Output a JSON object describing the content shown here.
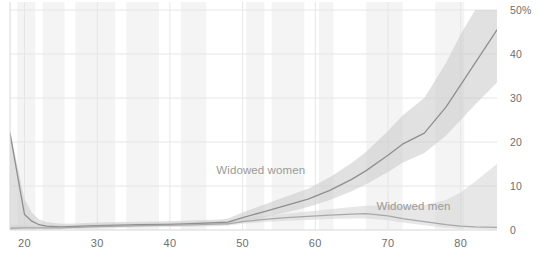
{
  "chart_data": {
    "type": "line",
    "title": "",
    "xlabel": "",
    "ylabel": "",
    "xlim": [
      18,
      85
    ],
    "ylim": [
      0,
      50
    ],
    "grid": true,
    "legend_position": "inline-annotation",
    "x_ticks": [
      20,
      30,
      40,
      50,
      60,
      70,
      80
    ],
    "x_tick_labels": [
      "20",
      "30",
      "40",
      "50",
      "60",
      "70",
      "80"
    ],
    "y_ticks": [
      0,
      10,
      20,
      30,
      40,
      50
    ],
    "y_tick_labels": [
      "0",
      "10",
      "20",
      "30",
      "40",
      "50%"
    ],
    "annotations": [
      {
        "text": "Widowed women",
        "x": 52.5,
        "y": 13.5
      },
      {
        "text": "Widowed men",
        "x": 73.5,
        "y": 5.2
      }
    ],
    "colors": {
      "line_women": "#8f8f8f",
      "line_men": "#a8a8a8",
      "band_women": "#c9c9c9",
      "band_men": "#cfcfcf",
      "grid": "#e6e6e6",
      "axis": "#d8d8d8",
      "tick_text": "#6e6e6e",
      "annotation_text": "#9a9a9a",
      "stripe": "#f4f4f4",
      "background": "#ffffff"
    },
    "x": [
      18,
      20,
      21,
      22,
      23,
      25,
      27,
      30,
      33,
      36,
      40,
      44,
      47,
      48,
      50,
      53,
      56,
      59,
      62,
      65,
      67,
      70,
      72,
      75,
      78,
      80,
      82,
      85
    ],
    "series": [
      {
        "name": "Widowed women",
        "values": [
          22.0,
          3.5,
          2.0,
          1.2,
          0.9,
          0.7,
          0.8,
          1.0,
          1.1,
          1.2,
          1.3,
          1.5,
          1.7,
          1.8,
          2.8,
          4.2,
          5.6,
          7.0,
          9.0,
          11.5,
          13.5,
          17.0,
          19.5,
          22.0,
          28.0,
          33.0,
          38.0,
          45.5
        ],
        "band_lower": [
          0.0,
          0.4,
          0.3,
          0.3,
          0.3,
          0.3,
          0.4,
          0.6,
          0.7,
          0.8,
          0.9,
          1.0,
          1.1,
          1.2,
          1.8,
          2.9,
          4.0,
          5.2,
          6.8,
          8.8,
          10.4,
          13.2,
          15.3,
          17.5,
          21.5,
          25.0,
          28.5,
          33.5
        ],
        "band_upper": [
          22.5,
          7.0,
          4.0,
          2.4,
          1.8,
          1.4,
          1.5,
          1.7,
          1.8,
          1.9,
          2.0,
          2.2,
          2.4,
          2.6,
          4.0,
          5.8,
          7.6,
          9.4,
          12.0,
          15.2,
          17.8,
          22.5,
          26.0,
          30.0,
          38.0,
          44.5,
          50.0,
          56.0
        ]
      },
      {
        "name": "Widowed men",
        "values": [
          0.4,
          0.5,
          0.5,
          0.5,
          0.5,
          0.5,
          0.6,
          0.8,
          0.9,
          1.0,
          1.1,
          1.2,
          1.4,
          1.4,
          1.9,
          2.4,
          2.8,
          3.1,
          3.4,
          3.6,
          3.7,
          3.2,
          2.6,
          1.9,
          1.2,
          0.9,
          0.7,
          0.6
        ],
        "band_lower": [
          0.0,
          0.1,
          0.1,
          0.1,
          0.1,
          0.2,
          0.2,
          0.4,
          0.5,
          0.6,
          0.7,
          0.8,
          0.9,
          1.0,
          1.4,
          1.8,
          2.1,
          2.3,
          2.5,
          2.6,
          2.6,
          2.2,
          1.7,
          1.1,
          0.5,
          0.3,
          0.2,
          0.1
        ],
        "band_upper": [
          1.2,
          1.1,
          1.0,
          1.0,
          1.0,
          1.0,
          1.1,
          1.3,
          1.4,
          1.5,
          1.6,
          1.8,
          2.0,
          2.1,
          2.6,
          3.2,
          3.7,
          4.2,
          4.7,
          5.2,
          5.5,
          5.6,
          5.5,
          5.6,
          6.8,
          8.5,
          11.0,
          15.0
        ]
      }
    ],
    "stripes": [
      {
        "from": 19.0,
        "to": 21.5
      },
      {
        "from": 22.5,
        "to": 25.5
      },
      {
        "from": 27.0,
        "to": 32.5
      },
      {
        "from": 34.0,
        "to": 38.5
      },
      {
        "from": 41.5,
        "to": 45.0
      },
      {
        "from": 50.5,
        "to": 53.0
      },
      {
        "from": 54.0,
        "to": 58.5
      },
      {
        "from": 60.5,
        "to": 62.5
      },
      {
        "from": 67.0,
        "to": 72.0
      },
      {
        "from": 76.5,
        "to": 80.5
      }
    ]
  }
}
